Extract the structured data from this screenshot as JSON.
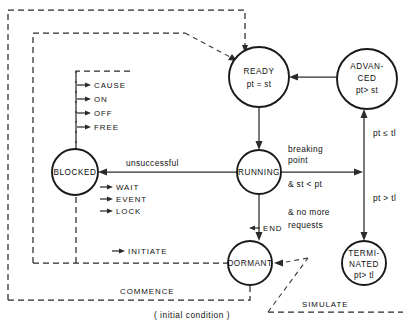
{
  "diagram": {
    "caption": "( initial condition )",
    "colors": {
      "background": "#ffffff",
      "stroke": "#2b2b2b",
      "node_stroke": "#1a1a1a",
      "text": "#111111"
    },
    "nodes": [
      {
        "id": "ready",
        "line1": "READY",
        "line2": "pt = st",
        "line3": "",
        "cx": 259,
        "cy": 77,
        "r": 30
      },
      {
        "id": "advanced",
        "line1": "ADVAN-",
        "line2": "CED",
        "line3": "pt> st",
        "cx": 367,
        "cy": 79,
        "r": 30
      },
      {
        "id": "blocked",
        "line1": "BLOCKED",
        "line2": "",
        "line3": "",
        "cx": 75,
        "cy": 172,
        "r": 23
      },
      {
        "id": "running",
        "line1": "RUNNING",
        "line2": "",
        "line3": "",
        "cx": 259,
        "cy": 172,
        "r": 22
      },
      {
        "id": "dormant",
        "line1": "DORMANT",
        "line2": "",
        "line3": "",
        "cx": 250,
        "cy": 263,
        "r": 22
      },
      {
        "id": "terminated",
        "line1": "TERMI-",
        "line2": "NATED",
        "line3": "pt> tl",
        "cx": 364,
        "cy": 263,
        "r": 22
      }
    ],
    "edge_labels": {
      "cause": "CAUSE",
      "on": "ON",
      "off": "OFF",
      "free": "FREE",
      "wait": "WAIT",
      "event": "EVENT",
      "lock": "LOCK",
      "unsuccessful": "unsuccessful",
      "breaking": "breaking",
      "point": "point",
      "st_lt_pt": "& st < pt",
      "no_more": "& no more",
      "requests": "requests",
      "end": "END",
      "initiate": "INITIATE",
      "commence": "COMMENCE",
      "simulate": "SIMULATE",
      "pt_le_tl": "pt ≤ tl",
      "pt_gt_tl": "pt > tl"
    }
  }
}
